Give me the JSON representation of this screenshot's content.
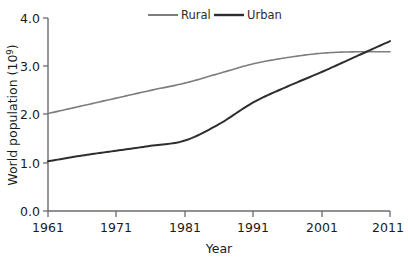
{
  "chart_data": {
    "type": "line",
    "title": "",
    "xlabel": "Year",
    "ylabel": "World population (10⁹)",
    "ylabel_base": "World population (10",
    "ylabel_exponent": "9",
    "ylabel_close": ")",
    "xlim": [
      1961,
      2011
    ],
    "ylim": [
      0.0,
      4.0
    ],
    "grid": false,
    "legend_position": "top-center",
    "x_ticks": [
      1961,
      1971,
      1981,
      1991,
      2001,
      2011
    ],
    "x_tick_labels": [
      "1961",
      "1971",
      "1981",
      "1991",
      "2001",
      "2011"
    ],
    "y_ticks": [
      0.0,
      1.0,
      2.0,
      3.0,
      4.0
    ],
    "y_tick_labels": [
      "0.0",
      "1.0",
      "2.0",
      "3.0",
      "4.0"
    ],
    "series": [
      {
        "name": "Rural",
        "color": "#7d7d7d",
        "line_width": 1.6,
        "x": [
          1961,
          1966,
          1971,
          1976,
          1981,
          1986,
          1991,
          1996,
          2001,
          2006,
          2011
        ],
        "values": [
          2.02,
          2.18,
          2.34,
          2.5,
          2.65,
          2.85,
          3.05,
          3.18,
          3.27,
          3.3,
          3.3
        ]
      },
      {
        "name": "Urban",
        "color": "#2e2e2e",
        "line_width": 2.0,
        "x": [
          1961,
          1966,
          1971,
          1976,
          1981,
          1986,
          1991,
          1996,
          2001,
          2006,
          2011
        ],
        "values": [
          1.03,
          1.15,
          1.25,
          1.35,
          1.46,
          1.8,
          2.25,
          2.58,
          2.88,
          3.2,
          3.52
        ]
      }
    ],
    "annotations": [
      {
        "text": "Urban overtakes Rural",
        "year": 2007,
        "value": 3.28,
        "rendered": false
      }
    ]
  },
  "legend": {
    "items": [
      {
        "label": "Rural",
        "color": "#7d7d7d"
      },
      {
        "label": "Urban",
        "color": "#2e2e2e"
      }
    ]
  },
  "axes": {
    "x_axis_label": "Year",
    "y_axis_label": "World population (10⁹)",
    "axis_color": "#6b6b6b"
  }
}
